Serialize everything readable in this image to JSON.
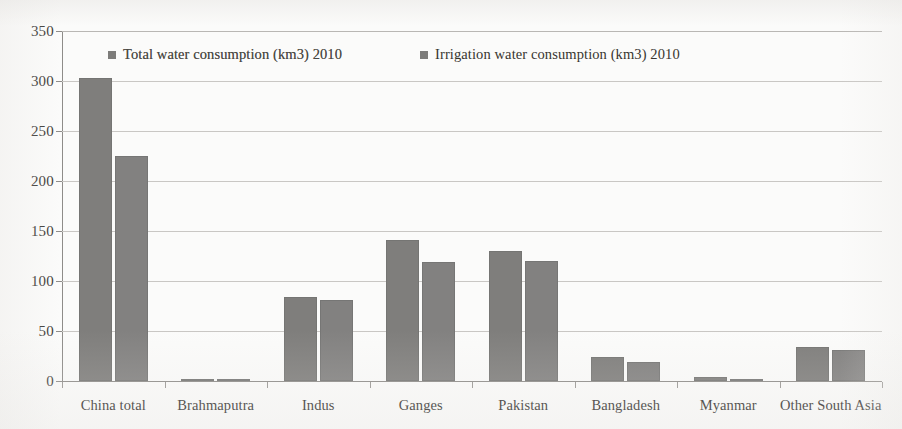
{
  "chart_data": {
    "type": "bar",
    "title": "",
    "xlabel": "",
    "ylabel": "",
    "ylim": [
      0,
      350
    ],
    "yticks": [
      0,
      50,
      100,
      150,
      200,
      250,
      300,
      350
    ],
    "ytick_labels": [
      "0",
      "50",
      "100",
      "150",
      "200",
      "250",
      "300",
      "350"
    ],
    "grid": true,
    "legend_position": "top-inside",
    "categories": [
      "China total",
      "Brahmaputra",
      "Indus",
      "Ganges",
      "Pakistan",
      "Bangladesh",
      "Myanmar",
      "Other South Asia"
    ],
    "series": [
      {
        "name": "Total water consumption (km3) 2010",
        "color": "#7f7e7c",
        "values": [
          303,
          2,
          84,
          141,
          130,
          24,
          4,
          34
        ]
      },
      {
        "name": "Irrigation water consumption (km3) 2010",
        "color": "#828180",
        "values": [
          225,
          2,
          81,
          119,
          120,
          19,
          2,
          31
        ]
      }
    ]
  },
  "legend": {
    "items": [
      {
        "label": "Total water consumption (km3) 2010",
        "marker": "square-marker"
      },
      {
        "label": "Irrigation water consumption (km3) 2010",
        "marker": "square-marker"
      }
    ]
  }
}
